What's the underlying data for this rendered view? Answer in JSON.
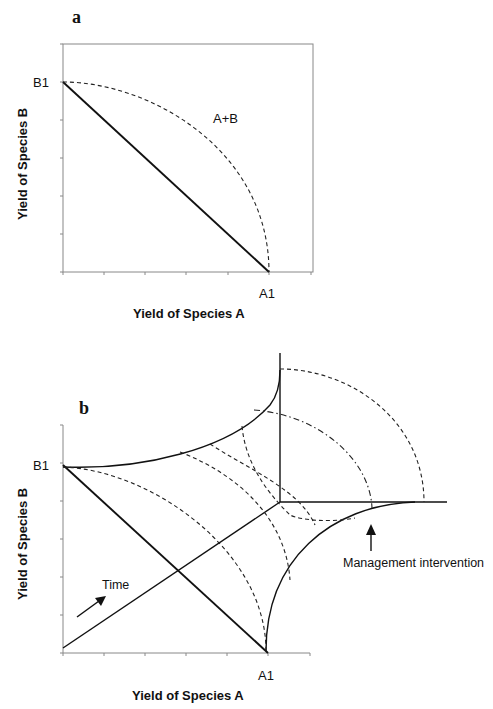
{
  "figure": {
    "panel_a": {
      "label": "a",
      "y_tick_label": "B1",
      "x_tick_label": "A1",
      "curve_label": "A+B",
      "x_axis_title": "Yield of Species A",
      "y_axis_title": "Yield of Species B"
    },
    "panel_b": {
      "label": "b",
      "y_tick_label": "B1",
      "x_tick_label": "A1",
      "time_label": "Time",
      "intervention_label": "Management intervention",
      "x_axis_title": "Yield of Species A",
      "y_axis_title": "Yield of Species B"
    }
  },
  "colors": {
    "line": "#111111",
    "axis": "#888888",
    "background": "#ffffff"
  }
}
